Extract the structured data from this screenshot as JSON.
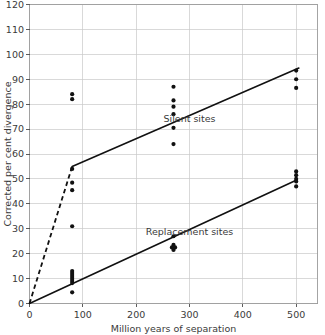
{
  "chart_data": {
    "type": "scatter",
    "title": "",
    "xlabel": "Million years of separation",
    "ylabel": "Corrected per cent divergence",
    "xlim": [
      0,
      540
    ],
    "ylim": [
      0,
      120
    ],
    "xticks": [
      0,
      100,
      200,
      300,
      400,
      500
    ],
    "yticks": [
      0,
      10,
      20,
      30,
      40,
      50,
      60,
      70,
      80,
      90,
      100,
      110,
      120
    ],
    "grid": true,
    "legend_position": "inline-annotation",
    "series": [
      {
        "name": "Silent sites",
        "annotation": "Silent sites",
        "annotation_x": 300,
        "annotation_y": 73,
        "line_style": "dashed-then-solid",
        "points": [
          {
            "x": 80,
            "y": 84.0
          },
          {
            "x": 80,
            "y": 82.0
          },
          {
            "x": 80,
            "y": 54.0
          },
          {
            "x": 80,
            "y": 48.5
          },
          {
            "x": 80,
            "y": 45.5
          },
          {
            "x": 80,
            "y": 31.0
          },
          {
            "x": 270,
            "y": 87.0
          },
          {
            "x": 270,
            "y": 81.5
          },
          {
            "x": 270,
            "y": 79.0
          },
          {
            "x": 270,
            "y": 76.0
          },
          {
            "x": 270,
            "y": 70.5
          },
          {
            "x": 270,
            "y": 64.0
          },
          {
            "x": 500,
            "y": 93.5
          },
          {
            "x": 500,
            "y": 90.0
          },
          {
            "x": 500,
            "y": 86.5
          }
        ],
        "trend_dashed": [
          {
            "x": 0,
            "y": 0
          },
          {
            "x": 80,
            "y": 55.0
          }
        ],
        "trend_solid": [
          {
            "x": 80,
            "y": 55.0
          },
          {
            "x": 505,
            "y": 94.5
          }
        ]
      },
      {
        "name": "Replacement sites",
        "annotation": "Replacement sites",
        "annotation_x": 300,
        "annotation_y": 27.5,
        "line_style": "solid",
        "points": [
          {
            "x": 80,
            "y": 13.0
          },
          {
            "x": 80,
            "y": 12.2
          },
          {
            "x": 80,
            "y": 11.4
          },
          {
            "x": 80,
            "y": 10.6
          },
          {
            "x": 80,
            "y": 9.8
          },
          {
            "x": 80,
            "y": 9.0
          },
          {
            "x": 80,
            "y": 8.2
          },
          {
            "x": 80,
            "y": 4.5
          },
          {
            "x": 270,
            "y": 27.0
          },
          {
            "x": 270,
            "y": 23.5
          },
          {
            "x": 267,
            "y": 22.5
          },
          {
            "x": 273,
            "y": 22.5
          },
          {
            "x": 270,
            "y": 21.5
          },
          {
            "x": 500,
            "y": 53.0
          },
          {
            "x": 500,
            "y": 51.5
          },
          {
            "x": 500,
            "y": 50.0
          },
          {
            "x": 500,
            "y": 49.0
          },
          {
            "x": 500,
            "y": 47.0
          }
        ],
        "trend_solid": [
          {
            "x": 0,
            "y": 0
          },
          {
            "x": 500,
            "y": 49.5
          }
        ]
      }
    ],
    "colors": {
      "data_point": "#111111",
      "trend_line": "#111111",
      "gridline": "#c9c9c9",
      "frame": "#9a9a9a",
      "text": "#3a3a3a",
      "background": "#ffffff"
    }
  }
}
